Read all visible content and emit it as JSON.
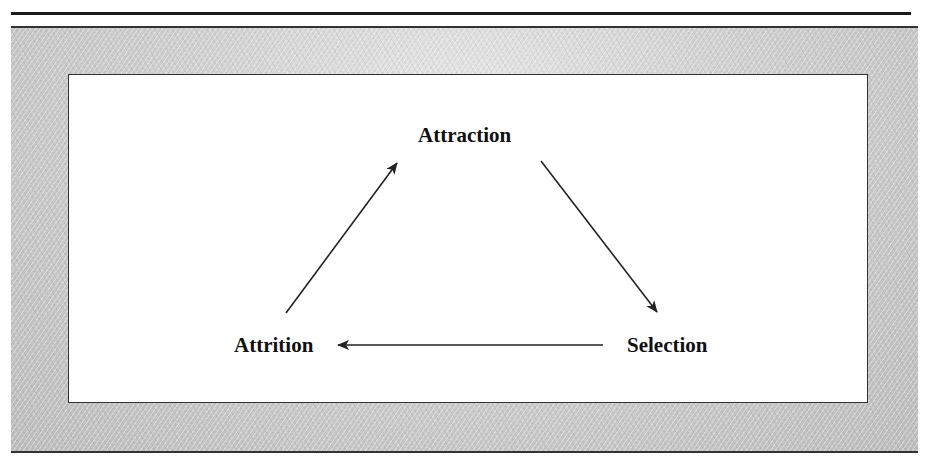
{
  "diagram": {
    "type": "cycle",
    "nodes": [
      {
        "id": "attraction",
        "label": "Attraction"
      },
      {
        "id": "selection",
        "label": "Selection"
      },
      {
        "id": "attrition",
        "label": "Attrition"
      }
    ],
    "edges": [
      {
        "from": "attraction",
        "to": "selection"
      },
      {
        "from": "selection",
        "to": "attrition"
      },
      {
        "from": "attrition",
        "to": "attraction"
      }
    ]
  },
  "colors": {
    "frame_texture": "#c8c8c8",
    "box_background": "#ffffff",
    "line": "#222222"
  }
}
